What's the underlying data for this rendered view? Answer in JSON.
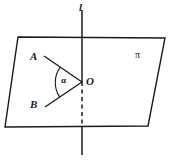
{
  "figure": {
    "type": "geometry-diagram",
    "width": 169,
    "height": 164,
    "background_color": "#ffffff",
    "stroke_color": "#1a1a1a",
    "labels": {
      "line": "l",
      "plane": "π",
      "point_a": "A",
      "point_b": "B",
      "vertex": "O",
      "angle": "α"
    },
    "caption": "",
    "geometry": {
      "plane_polygon": [
        [
          18,
          37
        ],
        [
          165,
          38
        ],
        [
          148,
          126
        ],
        [
          5,
          127
        ]
      ],
      "line_top": [
        82,
        10
      ],
      "line_bottom": [
        82,
        155
      ],
      "vertex_o": [
        82,
        82
      ],
      "point_a": [
        46,
        57
      ],
      "point_b": [
        47,
        106
      ],
      "dashed_segment": [
        [
          82,
          84
        ],
        [
          82,
          126
        ]
      ],
      "angle_arc_radius": 22
    }
  }
}
